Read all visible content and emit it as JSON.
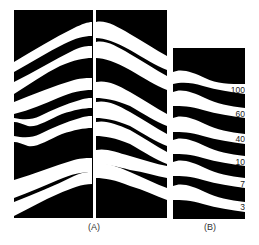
{
  "figure": {
    "panels": [
      {
        "id": "A",
        "label": "(A)"
      },
      {
        "id": "B",
        "label": "(B)",
        "band_labels": [
          "100",
          "60",
          "40",
          "10",
          "7",
          "3"
        ]
      }
    ]
  }
}
